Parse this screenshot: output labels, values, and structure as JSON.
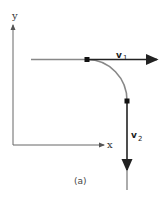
{
  "diagram": {
    "axes": {
      "y_label": "y",
      "x_label": "x"
    },
    "vectors": [
      {
        "name": "v",
        "subscript": "1",
        "direction": "right"
      },
      {
        "name": "v",
        "subscript": "2",
        "direction": "down"
      }
    ],
    "caption": "(a)",
    "colors": {
      "axis": "#555555",
      "path": "#777777",
      "vector": "#222222",
      "dot": "#111111"
    }
  }
}
